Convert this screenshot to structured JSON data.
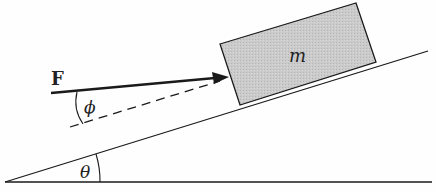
{
  "diagram": {
    "type": "physics-free-body",
    "labels": {
      "force": "F",
      "mass": "m",
      "force_angle": "ϕ",
      "incline_angle": "θ"
    },
    "colors": {
      "line": "#1a1a1a",
      "block_fill": "#c8c8c8",
      "background": "#fefefe"
    }
  }
}
